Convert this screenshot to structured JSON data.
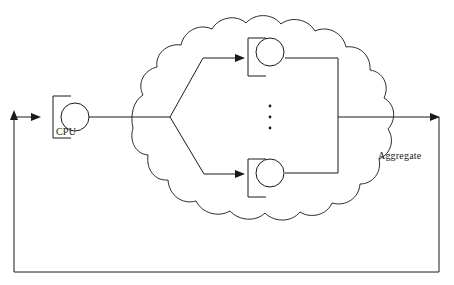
{
  "diagram": {
    "background_color": "#ffffff",
    "stroke_color": "#1a1a1a",
    "labels": {
      "cpu": "CPU",
      "aggregate": "Aggregate"
    },
    "nodes": [
      {
        "id": "cpu",
        "label": "CPU",
        "icon": "bracket-circle-node",
        "cx": 75,
        "cy": 117,
        "r": 14
      },
      {
        "id": "worker-top",
        "label": "",
        "icon": "bracket-circle-node",
        "cx": 270,
        "cy": 52,
        "r": 14
      },
      {
        "id": "worker-bottom",
        "label": "",
        "icon": "bracket-circle-node",
        "cx": 270,
        "cy": 173,
        "r": 14
      }
    ],
    "ellipsis": {
      "icon": "vertical-ellipsis",
      "count": 3,
      "x": 270,
      "y_values": [
        106,
        117,
        128
      ]
    },
    "cloud": {
      "icon": "cloud-shape",
      "left": 133,
      "right": 382,
      "top": 10,
      "bottom": 216
    },
    "edges": [
      {
        "id": "cpu-to-fanout",
        "from": "cpu",
        "to": "fan-out-junction",
        "arrow": false
      },
      {
        "id": "fanout-to-worker-top",
        "from": "fan-out-junction",
        "to": "worker-top",
        "arrow": true
      },
      {
        "id": "fanout-to-worker-bottom",
        "from": "fan-out-junction",
        "to": "worker-bottom",
        "arrow": true
      },
      {
        "id": "worker-top-to-collector",
        "from": "worker-top",
        "to": "collector",
        "arrow": false
      },
      {
        "id": "worker-bottom-to-collector",
        "from": "worker-bottom",
        "to": "collector",
        "arrow": false
      },
      {
        "id": "collector-to-aggregate-out",
        "from": "collector",
        "to": "feedback-right",
        "arrow": true
      },
      {
        "id": "feedback-loop",
        "from": "feedback-right",
        "to": "cpu",
        "arrow": true
      }
    ]
  }
}
